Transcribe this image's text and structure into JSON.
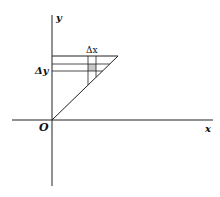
{
  "diagram": {
    "axes": {
      "x_label": "x",
      "y_label": "y",
      "origin_label": "O"
    },
    "annotations": {
      "delta_x": "Δx",
      "delta_y": "Δy"
    },
    "colors": {
      "stroke": "#222222",
      "shade": "#bdbdbd",
      "background": "#ffffff"
    }
  }
}
